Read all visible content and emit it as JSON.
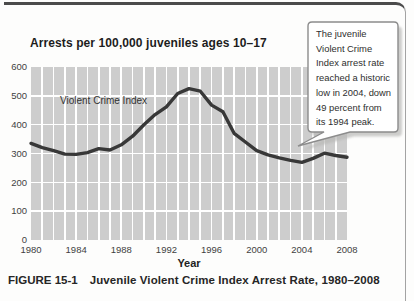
{
  "figure": {
    "caption_label": "FIGURE 15-1",
    "caption_title": "Juvenile Violent Crime Index Arrest Rate, 1980–2008"
  },
  "callout": {
    "text": "The juvenile\nViolent Crime\nIndex arrest rate\nreached a historic\nlow in 2004, down\n49 percent from\nits 1994 peak."
  },
  "chart_data": {
    "type": "line",
    "title": "Arrests per 100,000 juveniles ages 10–17",
    "series_label": "Violent Crime Index",
    "xlabel": "Year",
    "ylabel": "",
    "x": [
      1980,
      1981,
      1982,
      1983,
      1984,
      1985,
      1986,
      1987,
      1988,
      1989,
      1990,
      1991,
      1992,
      1993,
      1994,
      1995,
      1996,
      1997,
      1998,
      1999,
      2000,
      2001,
      2002,
      2003,
      2004,
      2005,
      2006,
      2007,
      2008
    ],
    "values": [
      335,
      320,
      310,
      298,
      297,
      303,
      317,
      312,
      330,
      360,
      400,
      435,
      462,
      508,
      525,
      516,
      468,
      445,
      370,
      340,
      310,
      295,
      285,
      276,
      269,
      283,
      301,
      293,
      287
    ],
    "ylim": [
      0,
      600
    ],
    "ytick_step": 100,
    "xticks": [
      1980,
      1984,
      1988,
      1992,
      1996,
      2000,
      2004,
      2008
    ],
    "grid": "white-on-gray",
    "legend_position": "inside-top-left",
    "colors": {
      "line": "#383838",
      "plot_bg": "#cdcdcd",
      "grid": "#ffffff",
      "tick_text": "#3f3f3f"
    }
  }
}
